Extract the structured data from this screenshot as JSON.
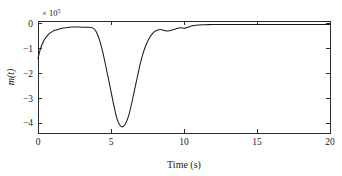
{
  "figure": {
    "background_color": "#ffffff",
    "axis_color": "#2b2b2b",
    "curve_color": "#1a1a1a"
  },
  "chart_data": {
    "type": "line",
    "title": "",
    "subtitle": "",
    "xlabel": "Time (s)",
    "ylabel": "m(t)",
    "y_exponent_label": "× 10",
    "y_exponent_power": "5",
    "y_scale_factor": 100000,
    "xlim": [
      0,
      20
    ],
    "ylim": [
      -4.4,
      0.12
    ],
    "xticks": [
      0,
      5,
      10,
      15,
      20
    ],
    "xtick_labels": [
      "0",
      "5",
      "10",
      "15",
      "20"
    ],
    "yticks": [
      0,
      -1,
      -2,
      -3,
      -4
    ],
    "ytick_labels": [
      "0",
      "−1",
      "−2",
      "−3",
      "−4"
    ],
    "grid": false,
    "legend": null,
    "legend_position": "none",
    "box_frame": true,
    "series": [
      {
        "name": "m(t)",
        "color": "#1a1a1a",
        "x": [
          0.0,
          0.1,
          0.2,
          0.3,
          0.45,
          0.6,
          0.8,
          1.0,
          1.2,
          1.4,
          1.6,
          1.8,
          2.0,
          2.2,
          2.4,
          2.6,
          2.8,
          3.0,
          3.2,
          3.4,
          3.6,
          3.8,
          4.0,
          4.2,
          4.4,
          4.6,
          4.8,
          5.0,
          5.2,
          5.4,
          5.6,
          5.8,
          6.0,
          6.2,
          6.4,
          6.6,
          6.8,
          7.0,
          7.2,
          7.4,
          7.6,
          7.8,
          8.0,
          8.2,
          8.4,
          8.6,
          8.8,
          9.0,
          9.2,
          9.4,
          9.6,
          9.8,
          10.0,
          10.2,
          10.4,
          10.6,
          10.8,
          11.0,
          11.5,
          12.0,
          12.5,
          13.0,
          13.5,
          14.0,
          14.5,
          15.0,
          15.5,
          16.0,
          16.5,
          17.0,
          17.5,
          18.0,
          18.5,
          19.0,
          19.5,
          20.0
        ],
        "y": [
          -1.4,
          -1.15,
          -0.95,
          -0.8,
          -0.62,
          -0.5,
          -0.38,
          -0.3,
          -0.25,
          -0.21,
          -0.18,
          -0.16,
          -0.14,
          -0.13,
          -0.12,
          -0.12,
          -0.12,
          -0.13,
          -0.13,
          -0.13,
          -0.14,
          -0.18,
          -0.32,
          -0.62,
          -1.05,
          -1.58,
          -2.15,
          -2.72,
          -3.3,
          -3.8,
          -4.08,
          -4.15,
          -4.02,
          -3.72,
          -3.25,
          -2.7,
          -2.15,
          -1.62,
          -1.18,
          -0.85,
          -0.6,
          -0.42,
          -0.3,
          -0.24,
          -0.22,
          -0.25,
          -0.28,
          -0.27,
          -0.24,
          -0.2,
          -0.17,
          -0.15,
          -0.17,
          -0.14,
          -0.1,
          -0.07,
          -0.05,
          -0.04,
          -0.03,
          -0.02,
          -0.02,
          -0.02,
          -0.02,
          -0.02,
          -0.02,
          -0.02,
          -0.02,
          -0.02,
          -0.02,
          -0.02,
          -0.02,
          -0.02,
          -0.02,
          -0.02,
          -0.02,
          -0.02
        ]
      }
    ],
    "annotations": [
      {
        "text": "minimum",
        "x": 5.8,
        "y": -4.15,
        "visible": false
      }
    ]
  }
}
